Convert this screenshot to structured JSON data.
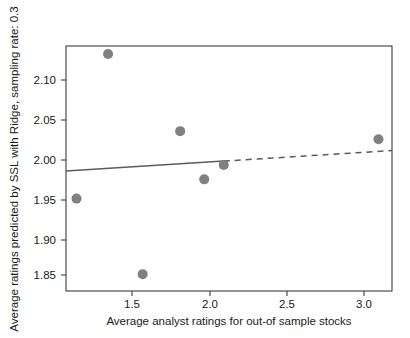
{
  "chart_data": {
    "type": "scatter",
    "title": "",
    "xlabel": "Average analyst ratings for out-of sample stocks",
    "ylabel": "Average ratings predicted by SSL with Ridge, sampling rate: 0.3",
    "xlim": [
      1.08,
      3.25
    ],
    "ylim": [
      1.828,
      2.133
    ],
    "xticks": [
      1.5,
      2.0,
      2.5,
      3.0
    ],
    "xtick_labels": [
      "1.5",
      "2.0",
      "2.5",
      "3.0"
    ],
    "yticks": [
      1.85,
      1.9,
      1.95,
      2.0,
      2.05,
      2.1
    ],
    "ytick_labels": [
      "1.85",
      "1.90",
      "1.95",
      "2.00",
      "2.05",
      "2.10"
    ],
    "grid": false,
    "legend": null,
    "marker_color": "#808080",
    "marker_size": 5,
    "points": [
      {
        "x": 1.15,
        "y": 1.943
      },
      {
        "x": 1.36,
        "y": 2.123
      },
      {
        "x": 1.59,
        "y": 1.849
      },
      {
        "x": 1.84,
        "y": 2.027
      },
      {
        "x": 2.0,
        "y": 1.967
      },
      {
        "x": 2.13,
        "y": 1.985
      },
      {
        "x": 3.16,
        "y": 2.017
      }
    ],
    "trend_line": {
      "color": "#5a5a5a",
      "solid_segment": {
        "x0": 1.08,
        "y0": 1.9775,
        "x1": 2.13,
        "y1": 1.9897
      },
      "dashed_segment": {
        "x0": 2.13,
        "y0": 1.9897,
        "x1": 3.25,
        "y1": 2.0028
      }
    }
  }
}
